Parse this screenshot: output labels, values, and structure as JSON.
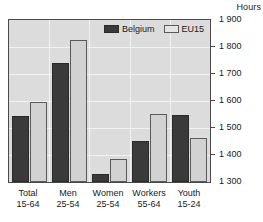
{
  "axis_unit_label": "Hours",
  "legend": {
    "position": "top-center-inside",
    "items": [
      {
        "label": "Belgium",
        "color": "#3a3a3a",
        "key": "belgium"
      },
      {
        "label": "EU15",
        "color": "#d2d2d2",
        "key": "eu15"
      }
    ]
  },
  "chart_data": {
    "type": "bar",
    "title": "",
    "subtitle": "",
    "xlabel": "",
    "ylabel": "Hours",
    "ylim": [
      1300,
      1900
    ],
    "ytick_step": 100,
    "ytick_labels": [
      "1 900",
      "1 800",
      "1 700",
      "1 600",
      "1 500",
      "1 400",
      "1 300"
    ],
    "yticks": [
      1900,
      1800,
      1700,
      1600,
      1500,
      1400,
      1300
    ],
    "grid": true,
    "grid_axis": "y",
    "legend_position": "top-center",
    "categories": [
      "Total\n15-64",
      "Men\n25-54",
      "Women\n25-54",
      "Workers\n55-64",
      "Youth\n15-24"
    ],
    "category_lines": [
      {
        "line1": "Total",
        "line2": "15-64"
      },
      {
        "line1": "Men",
        "line2": "25-54"
      },
      {
        "line1": "Women",
        "line2": "25-54"
      },
      {
        "line1": "Workers",
        "line2": "55-64"
      },
      {
        "line1": "Youth",
        "line2": "15-24"
      }
    ],
    "series": [
      {
        "name": "Belgium",
        "color": "#3a3a3a",
        "values": [
          1545,
          1740,
          1330,
          1450,
          1548
        ]
      },
      {
        "name": "EU15",
        "color": "#d2d2d2",
        "values": [
          1598,
          1825,
          1385,
          1552,
          1462
        ]
      }
    ]
  }
}
